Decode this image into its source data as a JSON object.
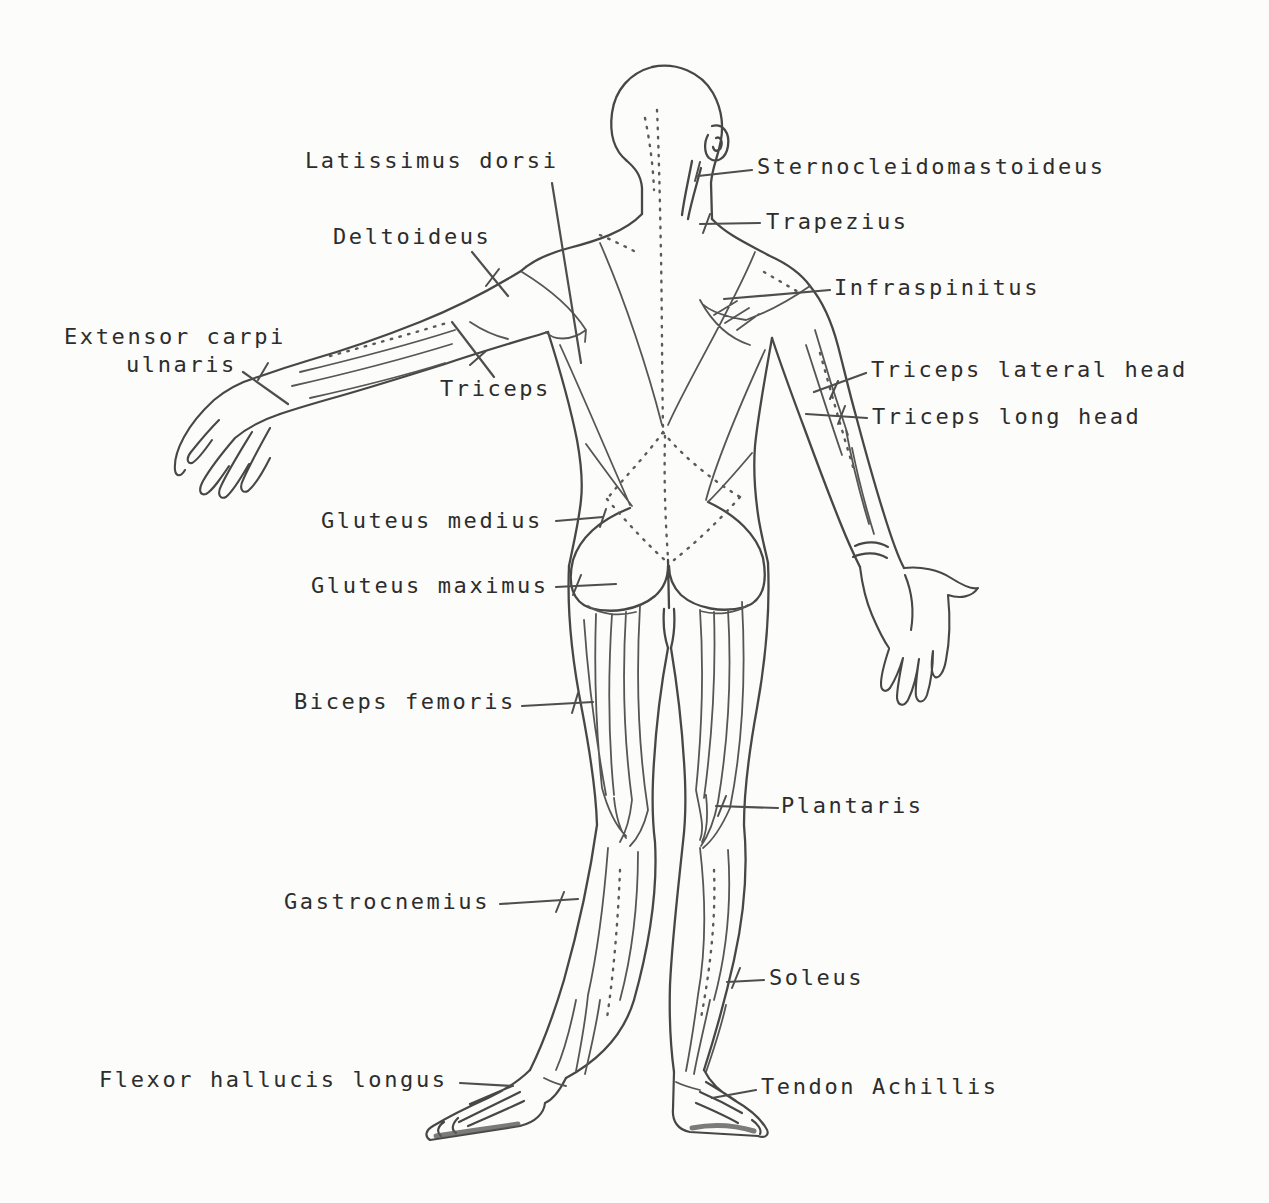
{
  "figure": {
    "type": "anatomical-line-drawing",
    "view": "posterior human musculature",
    "ink_color": "#4a4a4a",
    "text_color": "#2d2d2d",
    "paper_color": "#fcfcfa"
  },
  "labels": {
    "latissimus_dorsi": "Latissimus dorsi",
    "sternocleidomastoideus": "Sternocleidomastoideus",
    "deltoideus": "Deltoideus",
    "trapezius": "Trapezius",
    "infraspinitus": "Infraspinitus",
    "extensor_carpi_line1": "Extensor carpi",
    "extensor_carpi_line2": "ulnaris",
    "triceps": "Triceps",
    "triceps_lateral_head": "Triceps lateral head",
    "triceps_long_head": "Triceps long head",
    "gluteus_medius": "Gluteus medius",
    "gluteus_maximus": "Gluteus maximus",
    "biceps_femoris": "Biceps femoris",
    "plantaris": "Plantaris",
    "gastrocnemius": "Gastrocnemius",
    "soleus": "Soleus",
    "flexor_hallucis_longus": "Flexor hallucis longus",
    "tendon_achillis": "Tendon Achillis"
  }
}
